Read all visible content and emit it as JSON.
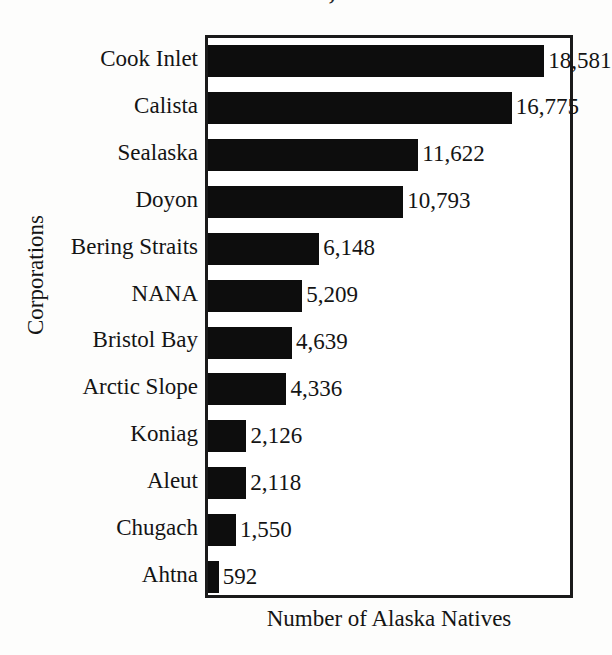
{
  "top_fragment": {
    "text": ", 99"
  },
  "chart_data": {
    "type": "bar",
    "orientation": "horizontal",
    "title": "",
    "xlabel": "Number of Alaska Natives",
    "ylabel": "Corporations",
    "xlim": [
      0,
      20000
    ],
    "grid": false,
    "legend": "none",
    "bar_color": "#0d0d0d",
    "frame_color": "#1a1a1a",
    "background": "#ffffff",
    "categories": [
      "Cook Inlet",
      "Calista",
      "Sealaska",
      "Doyon",
      "Bering Straits",
      "NANA",
      "Bristol Bay",
      "Arctic Slope",
      "Koniag",
      "Aleut",
      "Chugach",
      "Ahtna"
    ],
    "values": [
      18581,
      16775,
      11622,
      10793,
      6148,
      5209,
      4639,
      4336,
      2126,
      2118,
      1550,
      592
    ],
    "value_labels": [
      "18,581",
      "16,775",
      "11,622",
      "10,793",
      "6,148",
      "5,209",
      "4,639",
      "4,336",
      "2,126",
      "2,118",
      "1,550",
      "592"
    ]
  }
}
